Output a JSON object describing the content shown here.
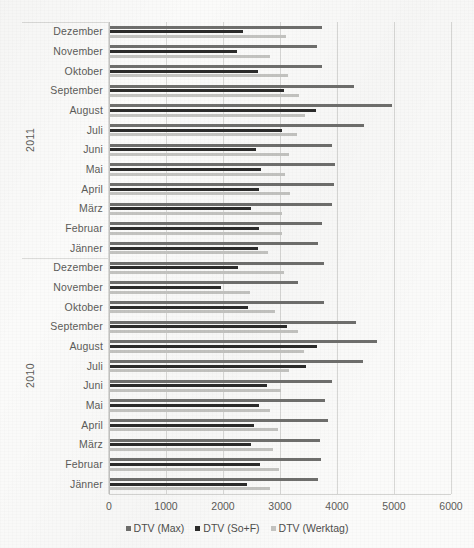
{
  "chart_data": {
    "type": "bar",
    "orientation": "horizontal",
    "title": "",
    "subtitle": "",
    "xlabel": "",
    "ylabel": "",
    "xlim": [
      0,
      6000
    ],
    "xticks": [
      0,
      1000,
      2000,
      3000,
      4000,
      5000,
      6000
    ],
    "xtick_labels": [
      "0",
      "1000",
      "2000",
      "3000",
      "4000",
      "5000",
      "6000"
    ],
    "grid": true,
    "legend_position": "bottom",
    "group_axis_labels": [
      "2011",
      "2010"
    ],
    "categories": [
      "Dezember",
      "November",
      "Oktober",
      "September",
      "August",
      "Juli",
      "Juni",
      "Mai",
      "April",
      "März",
      "Februar",
      "Jänner",
      "Dezember",
      "November",
      "Oktober",
      "September",
      "August",
      "Juli",
      "Juni",
      "Mai",
      "April",
      "März",
      "Februar",
      "Jänner"
    ],
    "groups": [
      {
        "year": "2011",
        "categories": [
          "Dezember",
          "November",
          "Oktober",
          "September",
          "August",
          "Juli",
          "Juni",
          "Mai",
          "April",
          "März",
          "Februar",
          "Jänner"
        ]
      },
      {
        "year": "2010",
        "categories": [
          "Dezember",
          "November",
          "Oktober",
          "September",
          "August",
          "Juli",
          "Juni",
          "Mai",
          "April",
          "März",
          "Februar",
          "Jänner"
        ]
      }
    ],
    "series": [
      {
        "name": "DTV (Max)",
        "color": "#6f6f6d",
        "values": [
          3720,
          3630,
          3720,
          4280,
          4950,
          4450,
          3900,
          3940,
          3930,
          3900,
          3720,
          3650,
          3750,
          3300,
          3760,
          4310,
          4680,
          4430,
          3900,
          3780,
          3830,
          3680,
          3700,
          3650
        ]
      },
      {
        "name": "DTV (So+F)",
        "color": "#2c2c2b",
        "values": [
          2340,
          2230,
          2590,
          3060,
          3620,
          3010,
          2560,
          2650,
          2620,
          2480,
          2620,
          2600,
          2250,
          1950,
          2420,
          3100,
          3630,
          3440,
          2760,
          2620,
          2520,
          2470,
          2630,
          2410
        ]
      },
      {
        "name": "DTV (Werktag)",
        "color": "#c4c4c1",
        "values": [
          3080,
          2800,
          3120,
          3320,
          3420,
          3280,
          3140,
          3070,
          3150,
          3020,
          3010,
          2770,
          3060,
          2450,
          2900,
          3300,
          3400,
          3140,
          3000,
          2800,
          2950,
          2860,
          2960,
          2800
        ]
      }
    ],
    "legend": [
      {
        "label": "DTV (Max)",
        "color": "#6f6f6d"
      },
      {
        "label": "DTV (So+F)",
        "color": "#2c2c2b"
      },
      {
        "label": "DTV (Werktag)",
        "color": "#c4c4c1"
      }
    ]
  },
  "colors": {
    "background": "#fbfbfa",
    "gridline": "#d8d8d6",
    "axis": "#c3c3c1",
    "text": "#5b5b59",
    "series_max": "#6f6f6d",
    "series_sof": "#2c2c2b",
    "series_werktag": "#c4c4c1"
  }
}
